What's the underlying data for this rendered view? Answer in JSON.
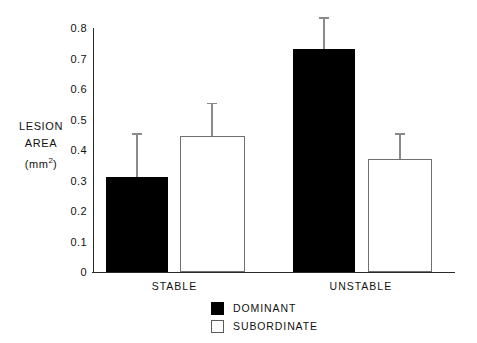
{
  "chart_data": {
    "type": "bar",
    "title": "",
    "subtitle": "",
    "xlabel": "",
    "ylabel": "LESION AREA (mm2)",
    "ylabel_lines": [
      "LESION",
      "AREA",
      "(mm"
    ],
    "ylabel_unit_base": "(mm",
    "ylabel_unit_sup": "2",
    "ylabel_unit_close": ")",
    "categories": [
      "STABLE",
      "UNSTABLE"
    ],
    "series": [
      {
        "name": "DOMINANT",
        "color": "#000000",
        "values": [
          0.31,
          0.73
        ],
        "errors_upper": [
          0.455,
          0.835
        ]
      },
      {
        "name": "SUBORDINATE",
        "color": "#ffffff",
        "values": [
          0.445,
          0.37
        ],
        "errors_upper": [
          0.555,
          0.455
        ]
      }
    ],
    "ylim": [
      0,
      0.8
    ],
    "yticks": [
      0,
      0.1,
      0.2,
      0.3,
      0.4,
      0.5,
      0.6,
      0.7,
      0.8
    ],
    "ytick_labels": [
      "0",
      "0.1",
      "0.2",
      "0.3",
      "0.4",
      "0.5",
      "0.6",
      "0.7",
      "0.8"
    ],
    "grid": false,
    "legend_position": "bottom-center",
    "error_bar_style": "upper-only-with-cap"
  },
  "bars": [
    {
      "name": "stable-dominant",
      "category": "STABLE",
      "series": "DOMINANT",
      "value": 0.31,
      "error_upper": 0.455,
      "fill": "#000000",
      "x_left_pct": 3.6,
      "width_pct": 17.1
    },
    {
      "name": "stable-subordinate",
      "category": "STABLE",
      "series": "SUBORDINATE",
      "value": 0.445,
      "error_upper": 0.555,
      "fill": "#ffffff",
      "x_left_pct": 24.0,
      "width_pct": 17.9
    },
    {
      "name": "unstable-dominant",
      "category": "UNSTABLE",
      "series": "DOMINANT",
      "value": 0.73,
      "error_upper": 0.835,
      "fill": "#000000",
      "x_left_pct": 55.2,
      "width_pct": 17.1
    },
    {
      "name": "unstable-subordinate",
      "category": "UNSTABLE",
      "series": "SUBORDINATE",
      "value": 0.37,
      "error_upper": 0.455,
      "fill": "#ffffff",
      "x_left_pct": 75.9,
      "width_pct": 17.7
    }
  ],
  "category_labels": [
    {
      "text": "STABLE",
      "x_pct": 22.5
    },
    {
      "text": "UNSTABLE",
      "x_pct": 74.0
    }
  ],
  "legend": {
    "items": [
      {
        "label": "DOMINANT",
        "swatch": "filled"
      },
      {
        "label": "SUBORDINATE",
        "swatch": "hollow"
      }
    ]
  }
}
